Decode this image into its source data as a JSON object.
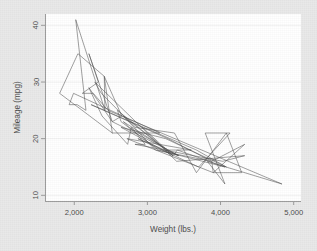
{
  "chart_data": {
    "type": "line",
    "title": "",
    "subtitle": "",
    "xlabel": "Weight (lbs.)",
    "ylabel": "Mileage (mpg)",
    "xlim": [
      1600,
      5100
    ],
    "ylim": [
      9,
      42
    ],
    "xticks": [
      2000,
      3000,
      4000,
      5000
    ],
    "xtick_labels": [
      "2,000",
      "3,000",
      "4,000",
      "5,000"
    ],
    "yticks": [
      10,
      20,
      30,
      40
    ],
    "ytick_labels": [
      "10",
      "20",
      "30",
      "40"
    ],
    "grid": "horizontal-faint",
    "legend": "none",
    "legend_position": "none",
    "series": [
      {
        "name": "Mileage vs Weight (connected in dataset order)",
        "color": "#4d4d4d",
        "line_width": 0.55,
        "marker": "none",
        "x": [
          2930,
          3350,
          2640,
          3250,
          4080,
          3670,
          2230,
          3280,
          3880,
          4330,
          3900,
          4290,
          4080,
          3670,
          3370,
          2830,
          2370,
          2280,
          3400,
          4330,
          4030,
          2830,
          2970,
          2780,
          2730,
          2380,
          2200,
          2520,
          2830,
          3430,
          3260,
          2590,
          2640,
          3150,
          4060,
          3410,
          3350,
          2670,
          3110,
          3880,
          3900,
          2720,
          3600,
          3280,
          2670,
          2750,
          3420,
          2870,
          3700,
          4130,
          3790,
          4060,
          3820,
          4840,
          2460,
          2260,
          2110,
          2330,
          2200,
          2520,
          2650,
          2410,
          2420,
          2020,
          2160,
          2040,
          1930,
          1990,
          3170,
          2520,
          1800,
          2050,
          2410,
          2520
        ],
        "y": [
          22,
          17,
          22,
          20,
          15,
          18,
          26,
          20,
          16,
          19,
          14,
          14,
          21,
          14,
          21,
          22,
          28,
          30,
          16,
          17,
          16,
          19,
          19,
          22,
          19,
          24,
          29,
          23,
          21,
          17,
          18,
          25,
          23,
          18,
          15,
          18,
          17,
          24,
          18,
          16,
          14,
          20,
          18,
          18,
          23,
          22,
          17,
          20,
          15,
          21,
          21,
          12,
          16,
          12,
          25,
          28,
          28,
          30,
          35,
          23,
          24,
          31,
          25,
          41,
          25,
          26,
          26,
          28,
          21,
          21,
          28,
          35,
          31,
          21
        ]
      }
    ]
  },
  "axes": {
    "xlabel": "Weight (lbs.)",
    "ylabel": "Mileage (mpg)",
    "xtick_labels": [
      "2,000",
      "3,000",
      "4,000",
      "5,000"
    ],
    "ytick_labels": [
      "10",
      "20",
      "30",
      "40"
    ]
  },
  "colors": {
    "line": "#4d4d4d",
    "axis": "#9a9a9a",
    "grid": "#f2f2f2",
    "plot_background": "#ffffff",
    "figure_background": "#e9e9e9",
    "text": "#4a4a4a"
  }
}
